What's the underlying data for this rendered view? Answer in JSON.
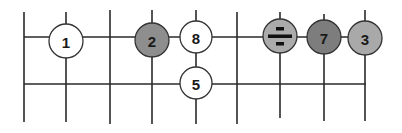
{
  "diagram": {
    "type": "grid-with-nodes",
    "grid": {
      "vertical_lines": [
        {
          "x": 24,
          "y1": 12,
          "y2": 122
        },
        {
          "x": 66,
          "y1": 12,
          "y2": 122
        },
        {
          "x": 110,
          "y1": 10,
          "y2": 124
        },
        {
          "x": 152,
          "y1": 10,
          "y2": 124
        },
        {
          "x": 196,
          "y1": 10,
          "y2": 124
        },
        {
          "x": 237,
          "y1": 12,
          "y2": 124
        },
        {
          "x": 280,
          "y1": 12,
          "y2": 118
        },
        {
          "x": 324,
          "y1": 14,
          "y2": 121
        },
        {
          "x": 365,
          "y1": 10,
          "y2": 121
        }
      ],
      "horizontal_lines": [
        {
          "y": 37,
          "x1": 24,
          "x2": 365
        },
        {
          "y": 84,
          "x1": 24,
          "x2": 366
        }
      ]
    },
    "nodes": [
      {
        "id": "node-1",
        "label": "1",
        "cx": 66,
        "cy": 41,
        "r": 17,
        "fill": "#ffffff"
      },
      {
        "id": "node-2",
        "label": "2",
        "cx": 152,
        "cy": 40,
        "r": 17,
        "fill": "#8e8e8e"
      },
      {
        "id": "node-8",
        "label": "8",
        "cx": 196,
        "cy": 37,
        "r": 16,
        "fill": "#ffffff"
      },
      {
        "id": "node-5",
        "label": "5",
        "cx": 196,
        "cy": 83,
        "r": 16,
        "fill": "#ffffff"
      },
      {
        "id": "node-divide",
        "label": "÷",
        "cx": 280,
        "cy": 36,
        "r": 17,
        "fill": "#ababab"
      },
      {
        "id": "node-7",
        "label": "7",
        "cx": 324,
        "cy": 37,
        "r": 17,
        "fill": "#7d7d7d"
      },
      {
        "id": "node-3",
        "label": "3",
        "cx": 365,
        "cy": 38,
        "r": 17,
        "fill": "#a9a9a9"
      }
    ],
    "colors": {
      "line": "#2a2a2a",
      "background": "#ffffff"
    }
  }
}
